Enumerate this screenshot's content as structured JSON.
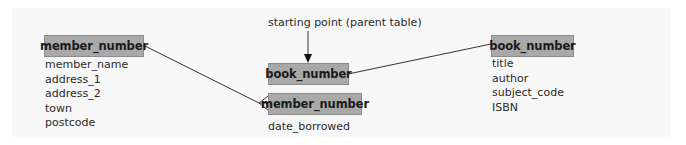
{
  "annotation": {
    "starting_point_label": "starting point (parent table)"
  },
  "tables": {
    "member": {
      "key": "member_number",
      "fields": [
        "member_name",
        "address_1",
        "address_2",
        "town",
        "postcode"
      ]
    },
    "loan": {
      "primary_key": "book_number",
      "foreign_key": "member_number",
      "fields": [
        "date_borrowed"
      ]
    },
    "book": {
      "key": "book_number",
      "fields": [
        "title",
        "author",
        "subject_code",
        "ISBN"
      ]
    }
  },
  "relationships": [
    {
      "from": "member.member_number",
      "to": "loan.member_number",
      "type": "one-to-many"
    },
    {
      "from": "loan.book_number",
      "to": "book.book_number",
      "type": "one-to-one"
    }
  ],
  "colors": {
    "panel_background": "#f7f7f7",
    "key_box_fill": "#a9a9a9",
    "key_box_border": "#8c8c8c",
    "line": "#333333",
    "text": "#2a2a2a"
  }
}
